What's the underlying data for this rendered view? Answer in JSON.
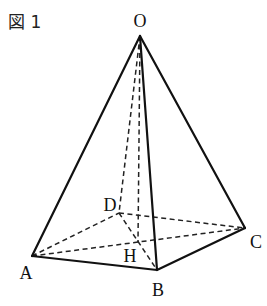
{
  "figure": {
    "label": "図 1",
    "type": "square pyramid",
    "vertices": {
      "O": {
        "label": "O",
        "x": 140,
        "y": 36,
        "lx": 140,
        "ly": 27
      },
      "A": {
        "label": "A",
        "x": 32,
        "y": 256,
        "lx": 26,
        "ly": 279
      },
      "B": {
        "label": "B",
        "x": 157,
        "y": 270,
        "lx": 158,
        "ly": 296
      },
      "C": {
        "label": "C",
        "x": 245,
        "y": 228,
        "lx": 256,
        "ly": 248
      },
      "D": {
        "label": "D",
        "x": 119,
        "y": 213,
        "lx": 110,
        "ly": 211
      },
      "H": {
        "label": "H",
        "x": 138,
        "y": 242,
        "lx": 130,
        "ly": 262
      }
    },
    "solid_edges": [
      [
        "O",
        "A"
      ],
      [
        "O",
        "B"
      ],
      [
        "O",
        "C"
      ],
      [
        "A",
        "B"
      ],
      [
        "B",
        "C"
      ]
    ],
    "hidden_edges": [
      [
        "O",
        "D"
      ],
      [
        "O",
        "H"
      ],
      [
        "A",
        "D"
      ],
      [
        "D",
        "C"
      ],
      [
        "A",
        "C"
      ],
      [
        "D",
        "B"
      ]
    ]
  }
}
